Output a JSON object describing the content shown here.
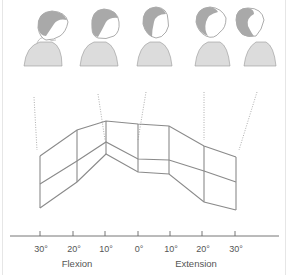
{
  "figure": {
    "heads": [
      {
        "position": "flexion-30",
        "tilt": "head flexed forward, chin down"
      },
      {
        "position": "flexion-15",
        "tilt": "head slightly flexed"
      },
      {
        "position": "neutral",
        "tilt": "head upright, neutral"
      },
      {
        "position": "extension-15",
        "tilt": "head slightly extended"
      },
      {
        "position": "extension-30",
        "tilt": "head extended back, chin up"
      }
    ],
    "axis": {
      "ticks": [
        "30°",
        "20°",
        "10°",
        "0°",
        "10°",
        "20°",
        "30°"
      ],
      "left_caption": "Flexion",
      "right_caption": "Extension"
    },
    "colors": {
      "line": "#8a8a8a",
      "hair": "#a9a9a9",
      "body_fill": "#dcdcdc",
      "dotted": "#999999",
      "text": "#555555"
    }
  }
}
